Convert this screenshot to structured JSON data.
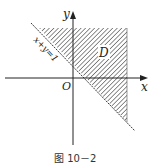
{
  "figure": {
    "caption": "图 10－2",
    "axis_x_label": "x",
    "axis_y_label": "y",
    "origin_label": "O",
    "region_label": "D",
    "line_label": "x+y=1",
    "colors": {
      "stroke": "#222222",
      "hatch": "#333333",
      "background": "#ffffff"
    }
  }
}
